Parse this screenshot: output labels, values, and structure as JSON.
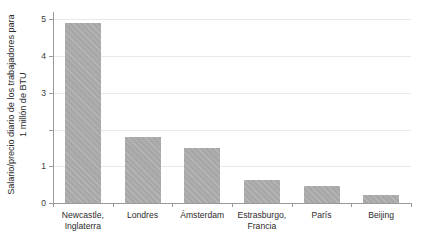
{
  "chart_data": {
    "type": "bar",
    "title": "",
    "xlabel": "",
    "ylabel": "Salario/precio diario de los trabajadores para 1 millón de BTU",
    "ylabel_lines": [
      "Salario/precio diario de los trabajadores para",
      "1 millón de BTU"
    ],
    "categories": [
      "Newcastle, Inglaterra",
      "Londres",
      "Ámsterdam",
      "Estrasburgo, Francia",
      "París",
      "Beijing"
    ],
    "category_lines": [
      [
        "Newcastle,",
        "Inglaterra"
      ],
      [
        "Londres"
      ],
      [
        "Ámsterdam"
      ],
      [
        "Estrasburgo,",
        "Francia"
      ],
      [
        "París"
      ],
      [
        "Beijing"
      ]
    ],
    "values": [
      4.9,
      1.8,
      1.5,
      0.63,
      0.45,
      0.22
    ],
    "ylim": [
      0,
      5.2
    ],
    "yticks": [
      0,
      1,
      2,
      3,
      4,
      5
    ],
    "ytick_labels": [
      "0",
      "1",
      "",
      "3",
      "4",
      "5"
    ],
    "grid": true,
    "grid_axis": "y",
    "legend": "none",
    "bar_color": "#a8a8a8",
    "grid_color": "#e9e9e9",
    "axis_color": "#9a9a9a",
    "text_color": "#2b2b2b"
  }
}
